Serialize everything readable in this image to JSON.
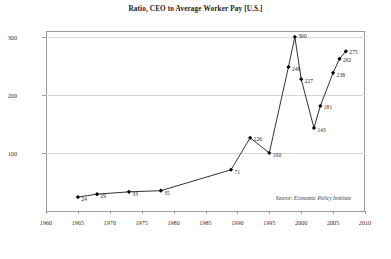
{
  "chart_data": {
    "type": "line",
    "title": "Ratio, CEO to Average Worker Pay [U.S.]",
    "xlabel": "",
    "ylabel": "",
    "xlim": [
      1960,
      2010
    ],
    "ylim": [
      0,
      310
    ],
    "grid": true,
    "legend": null,
    "y_ticks": [
      100,
      200,
      300
    ],
    "y_tick_labels": [
      "100",
      "200",
      "300"
    ],
    "x_ticks": [
      1960,
      1965,
      1970,
      1975,
      1980,
      1985,
      1990,
      1995,
      2000,
      2005,
      2010
    ],
    "x_tick_labels": [
      "1960",
      "1965",
      "1970",
      "1975",
      "1980",
      "1985",
      "1990",
      "1995",
      "2000",
      "2005",
      "2010"
    ],
    "marker": "filled-diamond",
    "line_color": "#1a1a1a",
    "marker_color": "#000000",
    "x": [
      1965,
      1968,
      1973,
      1978,
      1989,
      1992,
      1995,
      1998,
      1999,
      2000,
      2002,
      2003,
      2005,
      2006,
      2007
    ],
    "values": [
      24,
      29,
      33,
      35,
      71,
      126,
      100,
      248,
      300,
      227,
      143,
      181,
      238,
      262,
      275
    ],
    "point_labels": [
      "24",
      "29",
      "33",
      "35",
      "71",
      "126",
      "100",
      "248",
      "300",
      "227",
      "143",
      "181",
      "238",
      "262",
      "275"
    ],
    "annotation": "Source: Economic Policy Institute"
  },
  "colors": {
    "background": "#ffffff",
    "frame": "#9a9a9a",
    "grid": "#d8d8d8",
    "text": "#1a1a1a",
    "line": "#1a1a1a"
  }
}
